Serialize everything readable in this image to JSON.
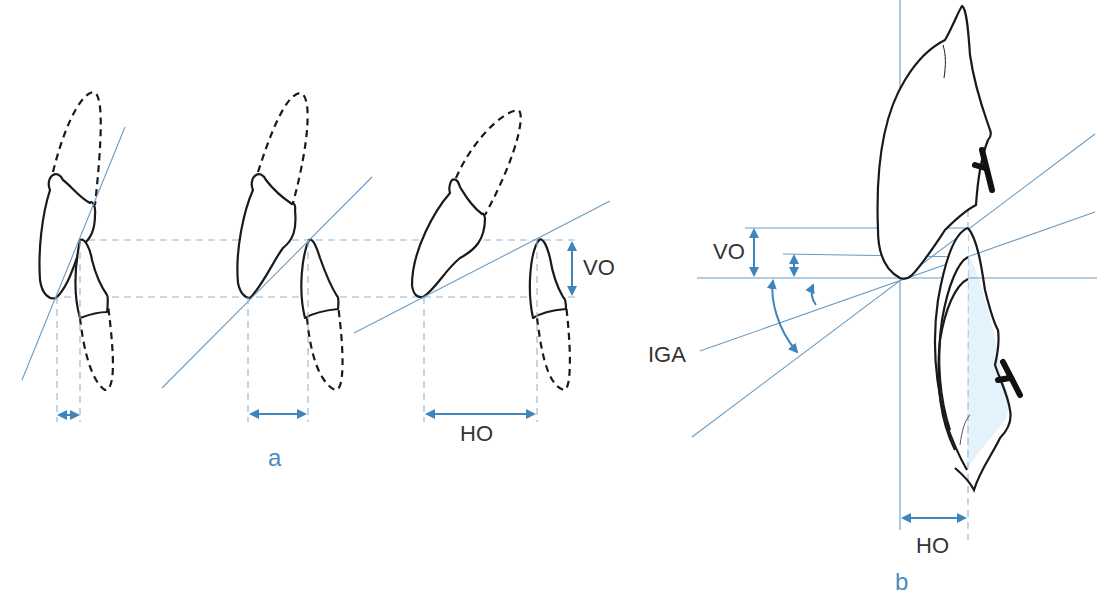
{
  "figure": {
    "panel_a": {
      "label": "a",
      "measure_labels": {
        "vertical_overlap": "VO",
        "horizontal_overlap": "HO"
      },
      "cases": [
        {
          "name": "small-horizontal-overlap"
        },
        {
          "name": "medium-horizontal-overlap"
        },
        {
          "name": "large-horizontal-overlap"
        }
      ]
    },
    "panel_b": {
      "label": "b",
      "measure_labels": {
        "vertical_overlap": "VO",
        "horizontal_overlap": "HO",
        "incisal_guidance_angle": "IGA"
      }
    },
    "colors": {
      "reference_line": "#6a9cc4",
      "measure_arrow": "#3f84bb",
      "panel_label": "#4a8dc0",
      "outline": "#1a1a1a",
      "lower_tooth_fill": "#e3f2fb"
    }
  }
}
